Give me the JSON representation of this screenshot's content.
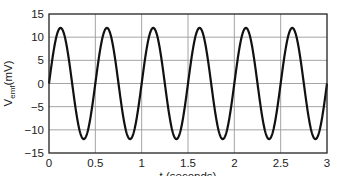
{
  "chart_data": {
    "type": "line",
    "title": "",
    "xlabel": "t (seconds)",
    "ylabel": "V_emf(mV)",
    "ylabel_main": "V",
    "ylabel_sub": "emf",
    "ylabel_unit": "(mV)",
    "xlim": [
      0,
      3
    ],
    "ylim": [
      -15,
      15
    ],
    "x_ticks": [
      0,
      0.5,
      1,
      1.5,
      2,
      2.5,
      3
    ],
    "x_tick_labels": [
      "0",
      "0.5",
      "1",
      "1.5",
      "2",
      "2.5",
      "3"
    ],
    "y_ticks": [
      -15,
      -10,
      -5,
      0,
      5,
      10,
      15
    ],
    "y_tick_labels": [
      "−15",
      "−10",
      "−5",
      "0",
      "5",
      "10",
      "15"
    ],
    "grid": true,
    "legend": null,
    "series": [
      {
        "name": "V_emf",
        "function": "12*sin(4*pi*t)",
        "amplitude": 12,
        "period": 0.5,
        "color": "#111111",
        "x": [
          0,
          0.125,
          0.25,
          0.375,
          0.5,
          0.625,
          0.75,
          0.875,
          1.0,
          1.125,
          1.25,
          1.375,
          1.5,
          1.625,
          1.75,
          1.875,
          2.0,
          2.125,
          2.25,
          2.375,
          2.5,
          2.625,
          2.75,
          2.875,
          3.0
        ],
        "values": [
          0,
          12,
          0,
          -12,
          0,
          12,
          0,
          -12,
          0,
          12,
          0,
          -12,
          0,
          12,
          0,
          -12,
          0,
          12,
          0,
          -12,
          0,
          12,
          0,
          -12,
          0
        ]
      }
    ]
  },
  "colors": {
    "line": "#111111",
    "grid": "#9a9a9a",
    "axis": "#222222"
  }
}
